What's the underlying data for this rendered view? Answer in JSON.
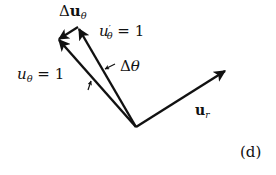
{
  "figure": {
    "panel_label": "(d)",
    "ink_color": "#111111",
    "origin": [
      136,
      127
    ],
    "vectors": {
      "u_theta": {
        "label_main": "u",
        "label_sub": "θ",
        "label_rest": " = 1",
        "tip": [
          58,
          39
        ]
      },
      "u_theta_prime": {
        "label_main": "u",
        "label_prime": "′",
        "label_sub": "θ",
        "label_rest": " = 1",
        "tip": [
          78,
          27
        ]
      },
      "delta_u_theta": {
        "label_delta": "Δ",
        "label_main": "u",
        "label_sub": "θ",
        "from": [
          78,
          27
        ],
        "to": [
          58,
          39
        ]
      },
      "u_r": {
        "label_main": "u",
        "label_sub": "r",
        "tip": [
          226,
          70
        ]
      }
    },
    "angle": {
      "label_delta": "Δ",
      "label_main": "θ"
    }
  }
}
